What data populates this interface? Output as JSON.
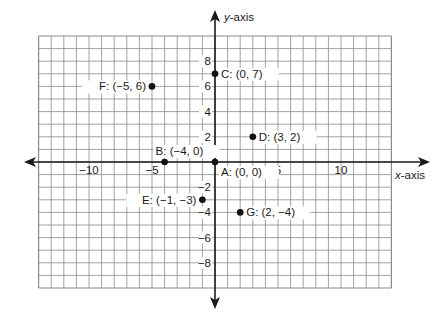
{
  "diagram": {
    "type": "coordinate-plane",
    "x_axis_label": "x-axis",
    "y_axis_label": "y-axis",
    "x_range": [
      -14,
      14
    ],
    "y_range": [
      -10,
      10
    ],
    "grid_step": 1,
    "x_ticks": [
      {
        "value": -10,
        "label": "−10"
      },
      {
        "value": -5,
        "label": "−5"
      },
      {
        "value": 5,
        "label": "5"
      },
      {
        "value": 10,
        "label": "10"
      }
    ],
    "y_ticks": [
      {
        "value": 8,
        "label": "8"
      },
      {
        "value": 6,
        "label": "6"
      },
      {
        "value": 4,
        "label": "4"
      },
      {
        "value": 2,
        "label": "2"
      },
      {
        "value": -2,
        "label": "−2"
      },
      {
        "value": -4,
        "label": "−4"
      },
      {
        "value": -6,
        "label": "−6"
      },
      {
        "value": -8,
        "label": "−8"
      }
    ],
    "points": [
      {
        "name": "A",
        "x": 0,
        "y": 0,
        "label": "A: (0, 0)",
        "label_side": "below-right"
      },
      {
        "name": "B",
        "x": -4,
        "y": 0,
        "label": "B: (−4, 0)",
        "label_side": "above-left"
      },
      {
        "name": "C",
        "x": 0,
        "y": 7,
        "label": "C: (0, 7)",
        "label_side": "right"
      },
      {
        "name": "D",
        "x": 3,
        "y": 2,
        "label": "D: (3, 2)",
        "label_side": "right"
      },
      {
        "name": "E",
        "x": -1,
        "y": -3,
        "label": "E: (−1, −3)",
        "label_side": "left"
      },
      {
        "name": "F",
        "x": -5,
        "y": 6,
        "label": "F: (−5, 6)",
        "label_side": "left"
      },
      {
        "name": "G",
        "x": 2,
        "y": -4,
        "label": "G: (2, −4)",
        "label_side": "right"
      }
    ],
    "colors": {
      "grid": "#8a8a8a",
      "axis": "#1a1a1a",
      "point": "#111111",
      "text": "#1a1a1a"
    }
  }
}
